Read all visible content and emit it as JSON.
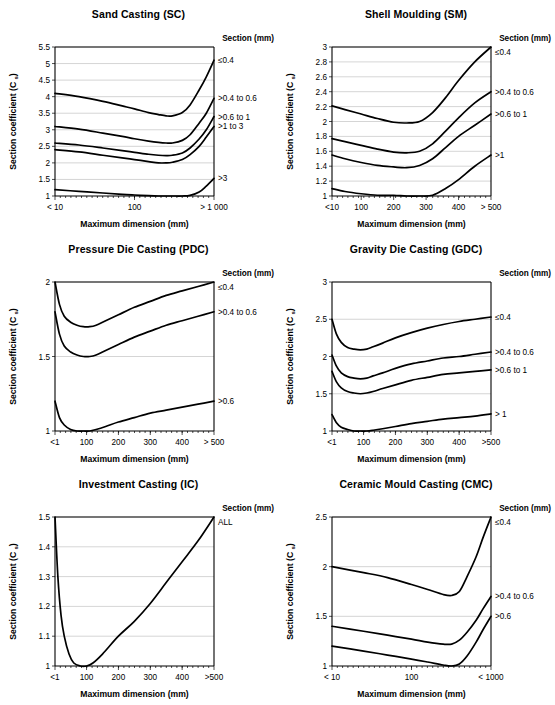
{
  "figure": {
    "axis_titles": {
      "x": "Maximum dimension (mm)",
      "y_main": "Section coefficient (C",
      "y_sub": "s",
      "y_close": ")"
    },
    "legend_header": "Section (mm)"
  },
  "chart_data": [
    {
      "type": "line",
      "id": "sand-casting",
      "title": "Sand Casting (SC)",
      "xlabel": "Maximum dimension (mm)",
      "ylabel": "Section coefficient (C s)",
      "legend_title": "Section (mm)",
      "legend_position": "right",
      "grid": true,
      "x_scale": "log",
      "xlim": [
        10,
        1000
      ],
      "ylim": [
        1,
        5.5
      ],
      "yticks": [
        1,
        1.5,
        2,
        2.5,
        3,
        3.5,
        4,
        4.5,
        5,
        5.5
      ],
      "ytick_labels": [
        "1",
        "1.5",
        "2",
        "2.5",
        "3",
        "3.5",
        "4",
        "4.5",
        "5",
        "5.5"
      ],
      "xticks": [
        10,
        100,
        1000
      ],
      "xtick_labels": [
        "< 10",
        "100",
        "> 1 000"
      ],
      "series": [
        {
          "name": "≤0.4",
          "x": [
            10,
            20,
            40,
            70,
            100,
            150,
            200,
            250,
            300,
            400,
            500,
            650,
            800,
            1000
          ],
          "values": [
            4.1,
            4.0,
            3.86,
            3.72,
            3.63,
            3.52,
            3.46,
            3.42,
            3.42,
            3.52,
            3.75,
            4.2,
            4.6,
            5.1
          ]
        },
        {
          "name": ">0.4 to 0.6",
          "x": [
            10,
            20,
            40,
            70,
            100,
            150,
            200,
            250,
            300,
            400,
            500,
            650,
            800,
            1000
          ],
          "values": [
            3.1,
            3.02,
            2.9,
            2.8,
            2.73,
            2.66,
            2.62,
            2.6,
            2.6,
            2.68,
            2.85,
            3.2,
            3.5,
            3.95
          ]
        },
        {
          "name": ">0.6 to 1",
          "x": [
            10,
            20,
            40,
            70,
            100,
            150,
            200,
            250,
            300,
            400,
            500,
            650,
            800,
            1000
          ],
          "values": [
            2.6,
            2.54,
            2.45,
            2.37,
            2.32,
            2.26,
            2.23,
            2.22,
            2.23,
            2.3,
            2.45,
            2.72,
            3.0,
            3.4
          ]
        },
        {
          "name": ">1 to 3",
          "x": [
            10,
            20,
            40,
            70,
            100,
            150,
            200,
            250,
            300,
            400,
            500,
            650,
            800,
            1000
          ],
          "values": [
            2.4,
            2.33,
            2.23,
            2.15,
            2.1,
            2.04,
            2.0,
            2.0,
            2.02,
            2.1,
            2.25,
            2.5,
            2.78,
            3.1
          ]
        },
        {
          "name": ">3",
          "x": [
            10,
            20,
            40,
            70,
            100,
            150,
            200,
            250,
            300,
            400,
            500,
            650,
            800,
            1000
          ],
          "values": [
            1.19,
            1.14,
            1.09,
            1.05,
            1.03,
            1.01,
            1.0,
            1.0,
            1.0,
            1.0,
            1.02,
            1.12,
            1.3,
            1.53
          ]
        }
      ]
    },
    {
      "type": "line",
      "id": "shell-moulding",
      "title": "Shell Moulding (SM)",
      "xlabel": "Maximum dimension (mm)",
      "ylabel": "Section coefficient (C s)",
      "legend_title": "Section (mm)",
      "legend_position": "right",
      "grid": true,
      "x_scale": "linear",
      "xlim": [
        10,
        500
      ],
      "ylim": [
        1,
        3
      ],
      "yticks": [
        1,
        1.2,
        1.4,
        1.6,
        1.8,
        2,
        2.2,
        2.4,
        2.6,
        2.8,
        3
      ],
      "ytick_labels": [
        "1",
        "1.2",
        "1.4",
        "1.6",
        "1.8",
        "2",
        "2.2",
        "2.4",
        "2.6",
        "2.8",
        "3"
      ],
      "xticks": [
        10,
        100,
        200,
        300,
        400,
        500
      ],
      "xtick_labels": [
        "<10",
        "100",
        "200",
        "300",
        "400",
        "> 500"
      ],
      "series": [
        {
          "name": "≤0.4",
          "x": [
            10,
            50,
            100,
            150,
            200,
            240,
            280,
            320,
            360,
            400,
            450,
            500
          ],
          "values": [
            2.21,
            2.16,
            2.1,
            2.04,
            1.99,
            1.98,
            2.0,
            2.12,
            2.32,
            2.55,
            2.8,
            3.0
          ]
        },
        {
          "name": ">0.4 to 0.6",
          "x": [
            10,
            50,
            100,
            150,
            200,
            240,
            280,
            320,
            360,
            400,
            450,
            500
          ],
          "values": [
            1.77,
            1.73,
            1.68,
            1.63,
            1.59,
            1.58,
            1.6,
            1.7,
            1.87,
            2.05,
            2.25,
            2.4
          ]
        },
        {
          "name": ">0.6 to 1",
          "x": [
            10,
            50,
            100,
            150,
            200,
            240,
            280,
            320,
            360,
            400,
            450,
            500
          ],
          "values": [
            1.55,
            1.5,
            1.45,
            1.41,
            1.39,
            1.38,
            1.41,
            1.5,
            1.65,
            1.8,
            1.95,
            2.1
          ]
        },
        {
          "name": ">1",
          "x": [
            10,
            50,
            100,
            150,
            200,
            240,
            280,
            320,
            360,
            400,
            450,
            500
          ],
          "values": [
            1.1,
            1.06,
            1.03,
            1.01,
            1.01,
            1.0,
            1.0,
            1.01,
            1.1,
            1.22,
            1.4,
            1.55
          ]
        }
      ]
    },
    {
      "type": "line",
      "id": "pressure-die-casting",
      "title": "Pressure Die Casting (PDC)",
      "xlabel": "Maximum dimension (mm)",
      "ylabel": "Section coefficient (C s)",
      "legend_title": "Section (mm)",
      "legend_position": "right",
      "grid": true,
      "x_scale": "linear",
      "xlim": [
        1,
        500
      ],
      "ylim": [
        1,
        2
      ],
      "yticks": [
        1,
        1.5,
        2
      ],
      "ytick_labels": [
        "1",
        "1.5",
        "2"
      ],
      "xticks": [
        1,
        100,
        200,
        300,
        400,
        500
      ],
      "xtick_labels": [
        "<1",
        "100",
        "200",
        "300",
        "400",
        "> 500"
      ],
      "series": [
        {
          "name": "≤0.4",
          "x": [
            1,
            15,
            30,
            50,
            70,
            90,
            110,
            130,
            160,
            200,
            250,
            300,
            350,
            400,
            450,
            500
          ],
          "values": [
            2.0,
            1.85,
            1.77,
            1.73,
            1.71,
            1.7,
            1.7,
            1.71,
            1.74,
            1.78,
            1.83,
            1.87,
            1.91,
            1.94,
            1.97,
            2.0
          ]
        },
        {
          "name": ">0.4 to 0.6",
          "x": [
            1,
            15,
            30,
            50,
            70,
            90,
            110,
            130,
            160,
            200,
            250,
            300,
            350,
            400,
            450,
            500
          ],
          "values": [
            1.8,
            1.65,
            1.57,
            1.53,
            1.51,
            1.5,
            1.5,
            1.51,
            1.54,
            1.58,
            1.63,
            1.67,
            1.71,
            1.74,
            1.77,
            1.8
          ]
        },
        {
          "name": ">0.6",
          "x": [
            1,
            15,
            30,
            50,
            70,
            90,
            110,
            130,
            160,
            200,
            250,
            300,
            350,
            400,
            450,
            500
          ],
          "values": [
            1.2,
            1.09,
            1.04,
            1.01,
            1.0,
            1.0,
            1.0,
            1.01,
            1.03,
            1.06,
            1.09,
            1.12,
            1.14,
            1.16,
            1.18,
            1.2
          ]
        }
      ]
    },
    {
      "type": "line",
      "id": "gravity-die-casting",
      "title": "Gravity Die Casting (GDC)",
      "xlabel": "Maximum dimension (mm)",
      "ylabel": "Section coefficient (C s)",
      "legend_title": "Section (mm)",
      "legend_position": "right",
      "grid": true,
      "x_scale": "linear",
      "xlim": [
        1,
        500
      ],
      "ylim": [
        1,
        3
      ],
      "yticks": [
        1,
        1.5,
        2,
        2.5,
        3
      ],
      "ytick_labels": [
        "1",
        "1.5",
        "2",
        "2.5",
        "3"
      ],
      "xticks": [
        1,
        100,
        200,
        300,
        400,
        500
      ],
      "xtick_labels": [
        "<1",
        "100",
        "200",
        "300",
        "400",
        ">500"
      ],
      "series": [
        {
          "name": "≤0.4",
          "x": [
            1,
            15,
            30,
            50,
            70,
            90,
            110,
            130,
            160,
            200,
            250,
            300,
            350,
            400,
            450,
            500
          ],
          "values": [
            2.5,
            2.3,
            2.19,
            2.12,
            2.1,
            2.09,
            2.1,
            2.13,
            2.18,
            2.25,
            2.32,
            2.38,
            2.43,
            2.47,
            2.5,
            2.53
          ]
        },
        {
          "name": ">0.4 to 0.6",
          "x": [
            1,
            15,
            30,
            50,
            70,
            90,
            110,
            130,
            160,
            200,
            250,
            300,
            350,
            400,
            450,
            500
          ],
          "values": [
            2.02,
            1.87,
            1.78,
            1.73,
            1.71,
            1.7,
            1.71,
            1.74,
            1.78,
            1.84,
            1.9,
            1.94,
            1.98,
            2.0,
            2.03,
            2.06
          ]
        },
        {
          "name": ">0.6 to 1",
          "x": [
            1,
            15,
            30,
            50,
            70,
            90,
            110,
            130,
            160,
            200,
            250,
            300,
            350,
            400,
            450,
            500
          ],
          "values": [
            1.8,
            1.66,
            1.58,
            1.53,
            1.51,
            1.5,
            1.51,
            1.53,
            1.57,
            1.62,
            1.68,
            1.72,
            1.76,
            1.78,
            1.8,
            1.82
          ]
        },
        {
          "name": "> 1",
          "x": [
            1,
            15,
            30,
            50,
            70,
            90,
            110,
            130,
            160,
            200,
            250,
            300,
            350,
            400,
            450,
            500
          ],
          "values": [
            1.22,
            1.11,
            1.05,
            1.02,
            1.0,
            1.0,
            1.0,
            1.01,
            1.03,
            1.06,
            1.1,
            1.13,
            1.16,
            1.18,
            1.2,
            1.23
          ]
        }
      ]
    },
    {
      "type": "line",
      "id": "investment-casting",
      "title": "Investment Casting (IC)",
      "xlabel": "Maximum dimension (mm)",
      "ylabel": "Section coefficient (C s)",
      "legend_title": "Section (mm)",
      "legend_position": "right",
      "grid": true,
      "x_scale": "linear",
      "xlim": [
        1,
        500
      ],
      "ylim": [
        1,
        1.5
      ],
      "yticks": [
        1,
        1.1,
        1.2,
        1.3,
        1.4,
        1.5
      ],
      "ytick_labels": [
        "1",
        "1.1",
        "1.2",
        "1.3",
        "1.4",
        "1.5"
      ],
      "xticks": [
        1,
        100,
        200,
        300,
        400,
        500
      ],
      "xtick_labels": [
        "<1",
        "100",
        "200",
        "300",
        "400",
        ">500"
      ],
      "series": [
        {
          "name": "ALL",
          "x": [
            1,
            10,
            20,
            30,
            45,
            60,
            80,
            100,
            120,
            150,
            200,
            250,
            300,
            350,
            400,
            450,
            500
          ],
          "values": [
            1.5,
            1.3,
            1.17,
            1.1,
            1.04,
            1.01,
            1.0,
            1.0,
            1.01,
            1.04,
            1.1,
            1.15,
            1.21,
            1.28,
            1.35,
            1.42,
            1.5
          ]
        }
      ]
    },
    {
      "type": "line",
      "id": "ceramic-mould-casting",
      "title": "Ceramic Mould Casting (CMC)",
      "xlabel": "Maximum dimension (mm)",
      "ylabel": "Section coefficient (C s)",
      "legend_title": "Section (mm)",
      "legend_position": "right",
      "grid": true,
      "x_scale": "log",
      "xlim": [
        10,
        1000
      ],
      "ylim": [
        1,
        2.5
      ],
      "yticks": [
        1,
        1.5,
        2,
        2.5
      ],
      "ytick_labels": [
        "1",
        "1.5",
        "2",
        "2.5"
      ],
      "xticks": [
        10,
        100,
        1000
      ],
      "xtick_labels": [
        "< 10",
        "100",
        "< 1000"
      ],
      "series": [
        {
          "name": "≤0.4",
          "x": [
            10,
            25,
            50,
            100,
            160,
            250,
            320,
            400,
            500,
            650,
            800,
            1000
          ],
          "values": [
            2.0,
            1.94,
            1.89,
            1.82,
            1.77,
            1.72,
            1.71,
            1.75,
            1.9,
            2.1,
            2.3,
            2.5
          ]
        },
        {
          "name": ">0.4 to 0.6",
          "x": [
            10,
            25,
            50,
            100,
            160,
            250,
            320,
            400,
            500,
            650,
            800,
            1000
          ],
          "values": [
            1.4,
            1.35,
            1.31,
            1.27,
            1.24,
            1.22,
            1.22,
            1.26,
            1.34,
            1.46,
            1.58,
            1.7
          ]
        },
        {
          "name": ">0.6",
          "x": [
            10,
            25,
            50,
            100,
            160,
            250,
            320,
            400,
            500,
            650,
            800,
            1000
          ],
          "values": [
            1.2,
            1.15,
            1.11,
            1.07,
            1.04,
            1.01,
            1.0,
            1.02,
            1.1,
            1.24,
            1.37,
            1.5
          ]
        }
      ]
    }
  ]
}
